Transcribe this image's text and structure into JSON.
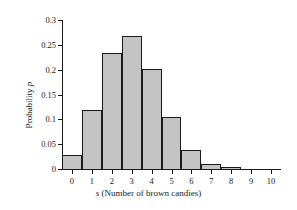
{
  "chart_data": {
    "type": "bar",
    "title": "",
    "subtitle": "",
    "xlabel": "s (Number of brown candies)",
    "xlabel_variable": "s",
    "xlabel_rest": " (Number of brown candies)",
    "ylabel": "Probability p",
    "ylabel_prefix": "Probability ",
    "ylabel_variable": "p",
    "categories": [
      0,
      1,
      2,
      3,
      4,
      5,
      6,
      7,
      8,
      9,
      10
    ],
    "values": [
      0.028,
      0.118,
      0.233,
      0.267,
      0.201,
      0.104,
      0.038,
      0.01,
      0.004,
      0.0,
      0.0
    ],
    "xtick_labels": [
      "0",
      "1",
      "2",
      "3",
      "4",
      "5",
      "6",
      "7",
      "8",
      "9",
      "10"
    ],
    "ytick_labels": [
      "0",
      "0.05",
      "0.1",
      "0.15",
      "0.2",
      "0.25",
      "0.3"
    ],
    "ytick_values": [
      0,
      0.05,
      0.1,
      0.15,
      0.2,
      0.25,
      0.3
    ],
    "ylim": [
      0,
      0.3
    ],
    "xlim": [
      -0.5,
      10.5
    ],
    "grid": false,
    "legend": false,
    "bar_fill_color": "#c4c4c4",
    "bar_edge_color": "#1a1a1a",
    "axis_color": "#1a1a1a",
    "background_color": "#ffffff",
    "bar_width": 1.0
  }
}
